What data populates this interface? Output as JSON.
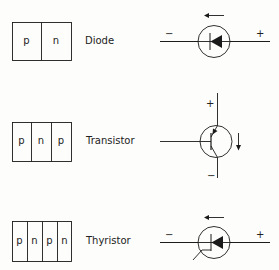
{
  "rows": [
    {
      "name": "Diode",
      "layers": [
        "p",
        "n"
      ],
      "symbol": {
        "left_sign": "−",
        "right_sign": "+",
        "current_arrow": "left"
      }
    },
    {
      "name": "Transistor",
      "layers": [
        "p",
        "n",
        "p"
      ],
      "symbol": {
        "top_sign": "+",
        "bottom_sign": "−",
        "current_arrow": "down"
      }
    },
    {
      "name": "Thyristor",
      "layers": [
        "p",
        "n",
        "p",
        "n"
      ],
      "symbol": {
        "left_sign": "−",
        "right_sign": "+",
        "current_arrow": "left"
      }
    }
  ],
  "colors": {
    "line": "#1a1a1a",
    "background": "#fdfdfb"
  }
}
